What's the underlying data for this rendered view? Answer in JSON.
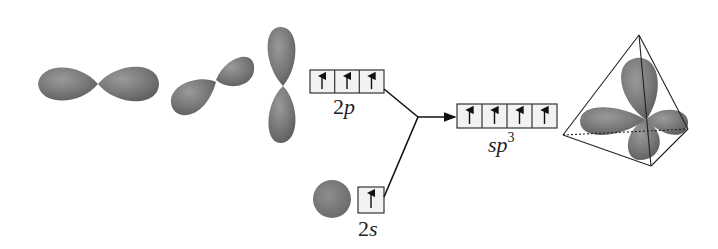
{
  "diagram": {
    "colors": {
      "orbital_fill": "#777777",
      "orbital_highlight": "#999999",
      "orbital_shadow": "#5e5e5e",
      "box_fill": "#f2f2f2",
      "line": "#111111"
    },
    "orbitals": [
      {
        "name": "p-x orbital",
        "type": "p",
        "orientation": "horizontal"
      },
      {
        "name": "p-y orbital",
        "type": "p",
        "orientation": "diagonal"
      },
      {
        "name": "p-z orbital",
        "type": "p",
        "orientation": "vertical"
      },
      {
        "name": "s orbital",
        "type": "s",
        "orientation": "sphere"
      },
      {
        "name": "sp3 hybrid orbitals",
        "type": "sp3",
        "orientation": "tetrahedral"
      }
    ],
    "levels": {
      "p": {
        "label_main": "2",
        "label_sub": "p",
        "electrons": [
          "↑",
          "↑",
          "↑"
        ]
      },
      "s": {
        "label_main": "2",
        "label_sub": "s",
        "electrons": [
          "↑"
        ]
      },
      "sp3": {
        "label_main": "sp",
        "label_sup": "3",
        "electrons": [
          "↑",
          "↑",
          "↑",
          "↑"
        ]
      }
    }
  }
}
